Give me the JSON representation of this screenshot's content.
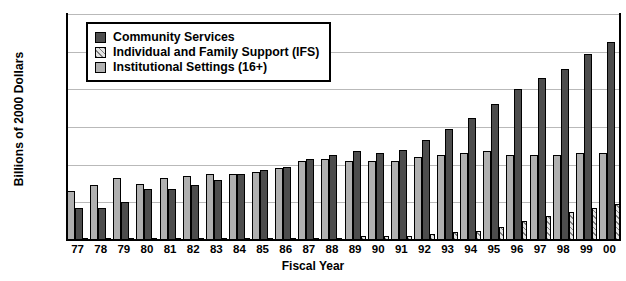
{
  "chart_data": {
    "type": "bar",
    "title": "",
    "xlabel": "Fiscal Year",
    "ylabel": "Billions of 2000 Dollars",
    "ylim": [
      0.0,
      1.2
    ],
    "ytick_labels": [
      "$1.2",
      "$1.0",
      "$0.8",
      "$0.6",
      "$0.4",
      "$0.2",
      "$0.0"
    ],
    "ytick_values": [
      1.2,
      1.0,
      0.8,
      0.6,
      0.4,
      0.2,
      0.0
    ],
    "grid": "horizontal",
    "legend_position": "top-left-inside",
    "categories": [
      "77",
      "78",
      "79",
      "80",
      "81",
      "82",
      "83",
      "84",
      "85",
      "86",
      "87",
      "88",
      "89",
      "90",
      "91",
      "92",
      "93",
      "94",
      "95",
      "96",
      "97",
      "98",
      "99",
      "00"
    ],
    "series": [
      {
        "name": "Institutional Settings (16+)",
        "color": "#b0b0b0",
        "values": [
          0.26,
          0.29,
          0.33,
          0.3,
          0.33,
          0.34,
          0.35,
          0.35,
          0.36,
          0.38,
          0.42,
          0.43,
          0.42,
          0.42,
          0.42,
          0.44,
          0.45,
          0.46,
          0.47,
          0.45,
          0.45,
          0.45,
          0.46,
          0.46
        ]
      },
      {
        "name": "Community Services",
        "color": "#4d4d4d",
        "values": [
          0.17,
          0.17,
          0.2,
          0.27,
          0.27,
          0.29,
          0.32,
          0.35,
          0.37,
          0.39,
          0.43,
          0.45,
          0.47,
          0.46,
          0.48,
          0.53,
          0.59,
          0.65,
          0.72,
          0.8,
          0.86,
          0.91,
          0.99,
          1.05
        ]
      },
      {
        "name": "Individual and Family Support (IFS)",
        "color": "#e4e4e4",
        "values": [
          0.01,
          0.01,
          0.01,
          0.01,
          0.01,
          0.01,
          0.01,
          0.01,
          0.01,
          0.01,
          0.01,
          0.01,
          0.02,
          0.02,
          0.02,
          0.03,
          0.04,
          0.05,
          0.07,
          0.1,
          0.13,
          0.15,
          0.17,
          0.19
        ]
      }
    ]
  },
  "legend": {
    "items": [
      {
        "label": "Community Services",
        "swatch": "community-swatch"
      },
      {
        "label": "Individual and Family Support (IFS)",
        "swatch": "ifs-swatch"
      },
      {
        "label": "Institutional Settings (16+)",
        "swatch": "institutional-swatch"
      }
    ]
  }
}
